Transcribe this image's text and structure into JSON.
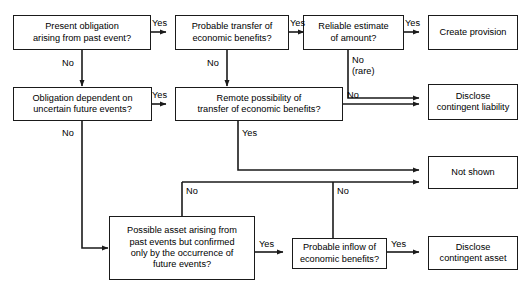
{
  "diagram": {
    "nodes": [
      {
        "id": "present_obligation",
        "text": "Present obligation\narising from past event?"
      },
      {
        "id": "probable_transfer",
        "text": "Probable transfer of\neconomic benefits?"
      },
      {
        "id": "reliable_estimate",
        "text": "Reliable estimate\nof amount?"
      },
      {
        "id": "create_provision",
        "text": "Create provision"
      },
      {
        "id": "obligation_dependent",
        "text": "Obligation dependent on\nuncertain future events?"
      },
      {
        "id": "remote_possibility",
        "text": "Remote possibility of\ntransfer of economic benefits?"
      },
      {
        "id": "disclose_contingent_liability",
        "text": "Disclose\ncontingent liability"
      },
      {
        "id": "not_shown",
        "text": "Not shown"
      },
      {
        "id": "possible_asset",
        "text": "Possible asset arising from\npast events but confirmed\nonly by the occurrence of\nfuture events?"
      },
      {
        "id": "probable_inflow",
        "text": "Probable inflow of\neconomic benefits?"
      },
      {
        "id": "disclose_contingent_asset",
        "text": "Disclose\ncontingent asset"
      }
    ],
    "edge_labels": [
      {
        "id": "yes_present_to_probable",
        "text": "Yes"
      },
      {
        "id": "no_present_to_obligation",
        "text": "No"
      },
      {
        "id": "yes_probable_to_reliable",
        "text": "Yes"
      },
      {
        "id": "no_probable_to_remote",
        "text": "No"
      },
      {
        "id": "yes_reliable_to_provision",
        "text": "Yes"
      },
      {
        "id": "no_rare_reliable_to_liability",
        "text": "No\n(rare)"
      },
      {
        "id": "yes_obligation_to_remote",
        "text": "Yes"
      },
      {
        "id": "no_obligation_to_possible_asset",
        "text": "No"
      },
      {
        "id": "no_remote_to_liability",
        "text": "No"
      },
      {
        "id": "yes_remote_to_not_shown",
        "text": "Yes"
      },
      {
        "id": "no_branch_to_possible_asset",
        "text": "No"
      },
      {
        "id": "no_branch_to_probable_inflow",
        "text": "No"
      },
      {
        "id": "yes_possible_asset_to_inflow",
        "text": "Yes"
      },
      {
        "id": "yes_inflow_to_contingent_asset",
        "text": "Yes"
      }
    ],
    "colors": {
      "stroke": "#1a1a1a",
      "fill": "#ffffff",
      "text": "#000000"
    }
  }
}
